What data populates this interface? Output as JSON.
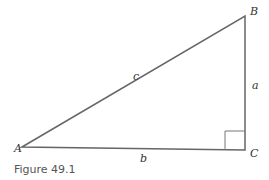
{
  "figure": {
    "caption": "Figure 49.1",
    "vertices": {
      "A": "A",
      "B": "B",
      "C": "C"
    },
    "sides": {
      "a": "a",
      "b": "b",
      "c": "c"
    },
    "right_angle_at": "C",
    "colors": {
      "line": "#666666",
      "text": "#333333"
    }
  }
}
